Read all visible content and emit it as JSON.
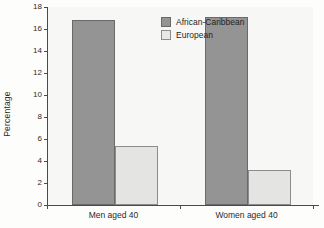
{
  "chart_data": {
    "type": "bar",
    "title": "",
    "xlabel": "",
    "ylabel": "Percentage",
    "ylim": [
      0,
      18
    ],
    "ytick_values": [
      0,
      2,
      4,
      6,
      8,
      10,
      12,
      14,
      16,
      18
    ],
    "ytick_labels": [
      "0",
      "2",
      "4",
      "6",
      "8",
      "10",
      "12",
      "14",
      "16",
      "18"
    ],
    "grid": false,
    "legend_position": "upper center-left (inside axes)",
    "categories": [
      "Men aged 40",
      "Women aged 40"
    ],
    "series": [
      {
        "name": "African-Caribbean",
        "color": "#949494",
        "values": [
          16.8,
          17.1
        ]
      },
      {
        "name": "European",
        "color": "#e4e4e2",
        "values": [
          5.4,
          3.2
        ]
      }
    ]
  },
  "legend": {
    "items": [
      {
        "label": "African-Caribbean",
        "swatch": "dark"
      },
      {
        "label": "European",
        "swatch": "light"
      }
    ]
  },
  "axes": {
    "y_title": "Percentage",
    "x_categories": [
      "Men aged 40",
      "Women aged 40"
    ]
  }
}
